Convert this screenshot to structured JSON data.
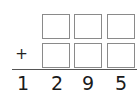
{
  "problem": {
    "operator": "+",
    "rows": [
      {
        "cells": [
          "",
          "",
          ""
        ]
      },
      {
        "cells": [
          "",
          "",
          ""
        ]
      }
    ],
    "result_digits": [
      "1",
      "2",
      "9",
      "5"
    ]
  }
}
